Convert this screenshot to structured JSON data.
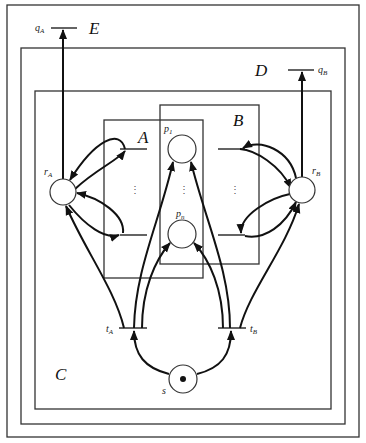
{
  "diagram": {
    "type": "petri-net",
    "regions": [
      {
        "id": "outer",
        "label": ""
      },
      {
        "id": "E",
        "label": "E"
      },
      {
        "id": "D",
        "label": "D"
      },
      {
        "id": "C",
        "label": "C"
      },
      {
        "id": "A",
        "label": "A"
      },
      {
        "id": "B",
        "label": "B"
      }
    ],
    "labels": {
      "E": "E",
      "D": "D",
      "C": "C",
      "A": "A",
      "B": "B"
    },
    "places": {
      "rA": {
        "main": "r",
        "sub": "A"
      },
      "rB": {
        "main": "r",
        "sub": "B"
      },
      "p1": {
        "main": "p",
        "sub": "1"
      },
      "pn": {
        "main": "p",
        "sub": "n"
      },
      "s": {
        "main": "s",
        "sub": "",
        "token": true
      }
    },
    "transitions": {
      "tA": {
        "main": "t",
        "sub": "A"
      },
      "tB": {
        "main": "t",
        "sub": "B"
      },
      "qA": {
        "main": "q",
        "sub": "A"
      },
      "qB": {
        "main": "q",
        "sub": "B"
      }
    },
    "ellipsis": "⋮"
  }
}
